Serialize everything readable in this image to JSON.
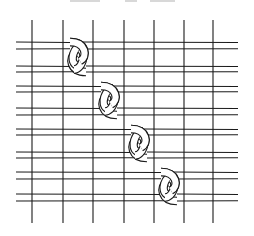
{
  "diagram": {
    "colors": {
      "stroke": "#1a1a1a",
      "background": "#ffffff",
      "caption_fragment": "#d8d8d8"
    },
    "vertical_lines": {
      "x": [
        32,
        63,
        93,
        124,
        154,
        184,
        213
      ],
      "y_top": 20,
      "y_bottom": 223
    },
    "strips": [
      {
        "top": 42,
        "bottom": 49
      },
      {
        "top": 66,
        "bottom": 72
      },
      {
        "top": 86,
        "bottom": 92
      },
      {
        "top": 108,
        "bottom": 115
      },
      {
        "top": 129,
        "bottom": 135
      },
      {
        "top": 152,
        "bottom": 158
      },
      {
        "top": 172,
        "bottom": 179
      },
      {
        "top": 194,
        "bottom": 201
      }
    ],
    "strip_x_range": [
      16,
      238
    ],
    "knots": [
      {
        "cx": 78,
        "upper_strip": 0,
        "lower_strip": 1
      },
      {
        "cx": 109,
        "upper_strip": 2,
        "lower_strip": 3
      },
      {
        "cx": 139,
        "upper_strip": 4,
        "lower_strip": 5
      },
      {
        "cx": 169,
        "upper_strip": 6,
        "lower_strip": 7
      }
    ]
  }
}
